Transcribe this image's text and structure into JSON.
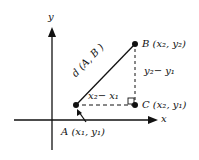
{
  "diagram": {
    "axes": {
      "x_label": "x",
      "y_label": "y"
    },
    "points": {
      "A": {
        "label": "A (x₁, y₁)"
      },
      "B": {
        "label": "B (x₂, y₂)"
      },
      "C": {
        "label": "C (x₂, y₁)"
      }
    },
    "segments": {
      "AB": "d (A, B )",
      "horizontal": "x₂− x₁",
      "vertical": "y₂− y₁"
    },
    "colors": {
      "ink": "#111111",
      "background": "#ffffff"
    }
  }
}
